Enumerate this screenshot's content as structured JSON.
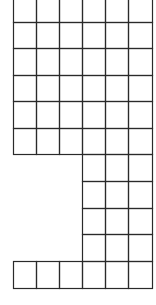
{
  "diagram": {
    "type": "grid-shape",
    "line_color": "#2a2a2a",
    "background": "#ffffff",
    "columns_x": [
      13,
      36,
      59,
      82,
      105,
      128,
      152
    ],
    "rows_y": [
      -4,
      22,
      48,
      75,
      101,
      128,
      154,
      181,
      208,
      234,
      261,
      288
    ],
    "regions": [
      {
        "name": "top-block",
        "col_start": 0,
        "col_end": 6,
        "row_start": 0,
        "row_end": 6
      },
      {
        "name": "right-tail",
        "col_start": 3,
        "col_end": 6,
        "row_start": 6,
        "row_end": 10
      },
      {
        "name": "bottom-row",
        "col_start": 0,
        "col_end": 6,
        "row_start": 10,
        "row_end": 11
      }
    ]
  }
}
